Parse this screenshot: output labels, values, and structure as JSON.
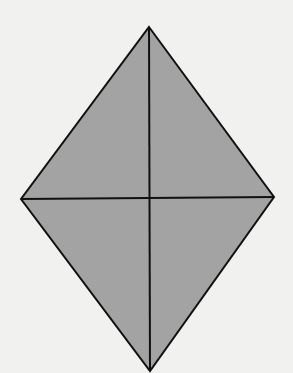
{
  "figure": {
    "shape": "rhombus",
    "vertices": {
      "top": [
        149,
        27
      ],
      "right": [
        274,
        197
      ],
      "bottom": [
        150,
        371
      ],
      "left": [
        21,
        199
      ]
    },
    "diagonals": [
      {
        "from": "top",
        "to": "bottom"
      },
      {
        "from": "left",
        "to": "right"
      }
    ],
    "colors": {
      "background": "#f1f1f0",
      "fill": "#a3a3a3",
      "stroke": "#111111"
    }
  }
}
